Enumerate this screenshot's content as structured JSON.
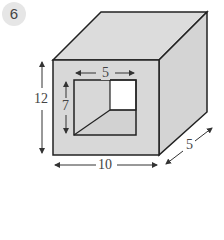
{
  "problem": {
    "number": "6"
  },
  "figure": {
    "type": "rectangular prism with rectangular hole through it",
    "colors": {
      "face": "#d8d8d8",
      "top_face": "#dcdcdc",
      "side_face": "#d4d4d4",
      "hole_back": "#ffffff",
      "edge": "#222222",
      "dimension_line": "#555555"
    },
    "dimensions": {
      "outer_height": "12",
      "outer_width": "10",
      "depth": "5",
      "hole_width": "5",
      "hole_height": "7"
    }
  }
}
